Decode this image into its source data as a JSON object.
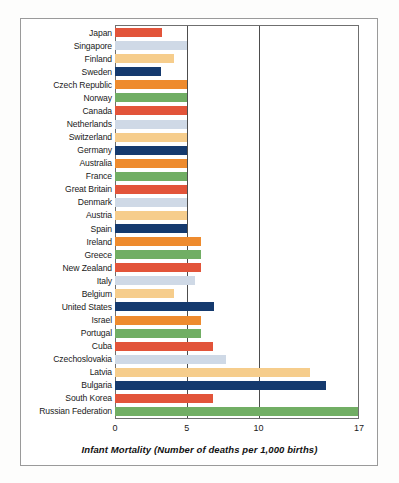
{
  "chart_data": {
    "type": "bar",
    "orientation": "horizontal",
    "title": "",
    "xlabel": "Infant Mortality (Number of deaths per 1,000 births)",
    "ylabel": "",
    "xlim": [
      0,
      17
    ],
    "xticks": [
      0,
      5,
      10,
      17
    ],
    "xtick_labels": [
      "0",
      "5",
      "10",
      "17"
    ],
    "gridlines_x": [
      5,
      10
    ],
    "grid": true,
    "legend": false,
    "categories": [
      "Japan",
      "Singapore",
      "Finland",
      "Sweden",
      "Czech Republic",
      "Norway",
      "Canada",
      "Netherlands",
      "Switzerland",
      "Germany",
      "Australia",
      "France",
      "Great Britain",
      "Denmark",
      "Austria",
      "Spain",
      "Ireland",
      "Greece",
      "New Zealand",
      "Italy",
      "Belgium",
      "United States",
      "Israel",
      "Portugal",
      "Cuba",
      "Czechoslovakia",
      "Latvia",
      "Bulgaria",
      "South Korea",
      "Russian Federation"
    ],
    "values": [
      3.3,
      5.0,
      4.1,
      3.2,
      5.0,
      5.0,
      5.0,
      5.0,
      5.0,
      5.0,
      5.0,
      5.0,
      5.0,
      5.0,
      5.0,
      5.0,
      6.0,
      6.0,
      6.0,
      5.6,
      4.1,
      6.9,
      6.0,
      6.0,
      6.8,
      7.7,
      13.6,
      14.7,
      6.8,
      17.0
    ],
    "bar_colors": [
      "#E2543A",
      "#CFD9E6",
      "#F6CD8C",
      "#153A6E",
      "#EE8B2E",
      "#71AE64",
      "#E2543A",
      "#CFD9E6",
      "#F6CD8C",
      "#153A6E",
      "#EE8B2E",
      "#71AE64",
      "#E2543A",
      "#CFD9E6",
      "#F6CD8C",
      "#153A6E",
      "#EE8B2E",
      "#71AE64",
      "#E2543A",
      "#CFD9E6",
      "#F6CD8C",
      "#153A6E",
      "#EE8B2E",
      "#71AE64",
      "#E2543A",
      "#CFD9E6",
      "#F6CD8C",
      "#153A6E",
      "#E2543A",
      "#71AE64"
    ],
    "palette": {
      "red": "#E2543A",
      "light_blue": "#CFD9E6",
      "peach": "#F6CD8C",
      "navy": "#153A6E",
      "orange": "#EE8B2E",
      "green": "#71AE64"
    }
  },
  "frame": {
    "border_color": "#9a9a9a",
    "plot_border_color": "#6f6f6f",
    "background": "#ffffff"
  }
}
